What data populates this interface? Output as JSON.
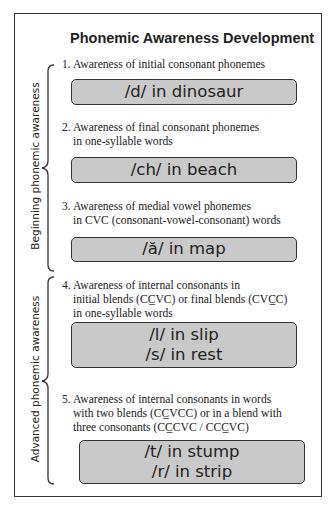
{
  "title": "Phonemic Awareness Development",
  "groups": [
    {
      "label": "Beginning phonemic awareness",
      "items": [
        0,
        1,
        2
      ]
    },
    {
      "label": "Advanced phonemic awareness",
      "items": [
        3,
        4
      ]
    }
  ],
  "items": [
    {
      "number": "1.",
      "lines": [
        "Awareness of initial consonant phonemes"
      ],
      "examples": [
        "/d/ in dinosaur"
      ]
    },
    {
      "number": "2.",
      "lines": [
        "Awareness of final consonant phonemes",
        "in one-syllable words"
      ],
      "examples": [
        "/ch/ in beach"
      ]
    },
    {
      "number": "3.",
      "lines": [
        "Awareness of medial vowel phonemes",
        "in CVC (consonant-vowel-consonant) words"
      ],
      "examples": [
        "/ă/ in map"
      ]
    },
    {
      "number": "4.",
      "lines": [
        "Awareness of internal consonants in",
        "initial blends (CC̲VC) or final blends (CVC̲C)",
        "in one-syllable words"
      ],
      "examples": [
        "/l/ in slip",
        "/s/ in rest"
      ]
    },
    {
      "number": "5.",
      "lines": [
        "Awareness of internal consonants in words",
        "with two blends (CC̲VCC) or in a blend with",
        "three consonants (CC̲CVC / CCC̲VC)"
      ],
      "examples": [
        "/t/ in stump",
        "/r/ in strip"
      ]
    }
  ]
}
